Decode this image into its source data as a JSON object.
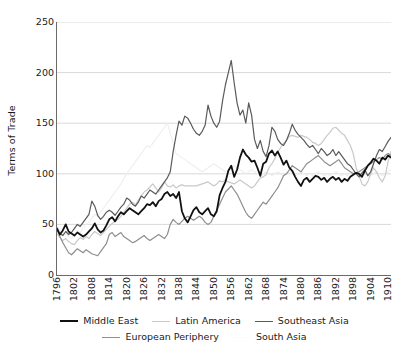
{
  "chart_data": {
    "type": "line",
    "title": "",
    "xlabel": "",
    "ylabel": "Terms of Trade",
    "xlim": [
      1796,
      1911
    ],
    "ylim": [
      0,
      250
    ],
    "yticks": [
      0,
      50,
      100,
      150,
      200,
      250
    ],
    "xticks": [
      1796,
      1802,
      1808,
      1814,
      1820,
      1826,
      1832,
      1838,
      1844,
      1850,
      1856,
      1862,
      1868,
      1874,
      1880,
      1886,
      1892,
      1898,
      1904,
      1910
    ],
    "grid": "horizontal",
    "legend_position": "below",
    "colors": {
      "middle_east": "#111111",
      "latin_america": "#c9c9c9",
      "southeast_asia": "#5a5a5a",
      "european_periphery": "#8e8e8e",
      "south_asia": "#eeeeee"
    },
    "x": [
      1796,
      1797,
      1798,
      1799,
      1800,
      1801,
      1802,
      1803,
      1804,
      1805,
      1806,
      1807,
      1808,
      1809,
      1810,
      1811,
      1812,
      1813,
      1814,
      1815,
      1816,
      1817,
      1818,
      1819,
      1820,
      1821,
      1822,
      1823,
      1824,
      1825,
      1826,
      1827,
      1828,
      1829,
      1830,
      1831,
      1832,
      1833,
      1834,
      1835,
      1836,
      1837,
      1838,
      1839,
      1840,
      1841,
      1842,
      1843,
      1844,
      1845,
      1846,
      1847,
      1848,
      1849,
      1850,
      1851,
      1852,
      1853,
      1854,
      1855,
      1856,
      1857,
      1858,
      1859,
      1860,
      1861,
      1862,
      1863,
      1864,
      1865,
      1866,
      1867,
      1868,
      1869,
      1870,
      1871,
      1872,
      1873,
      1874,
      1875,
      1876,
      1877,
      1878,
      1879,
      1880,
      1881,
      1882,
      1883,
      1884,
      1885,
      1886,
      1887,
      1888,
      1889,
      1890,
      1891,
      1892,
      1893,
      1894,
      1895,
      1896,
      1897,
      1898,
      1899,
      1900,
      1901,
      1902,
      1903,
      1904,
      1905,
      1906,
      1907,
      1908,
      1909,
      1910,
      1911
    ],
    "series": [
      {
        "name": "Middle East",
        "color": "#111111",
        "width": 1.8,
        "values": [
          46,
          40,
          44,
          50,
          43,
          41,
          39,
          42,
          40,
          38,
          40,
          43,
          46,
          51,
          45,
          42,
          44,
          49,
          55,
          57,
          53,
          58,
          62,
          60,
          63,
          66,
          64,
          62,
          60,
          63,
          66,
          70,
          69,
          72,
          68,
          73,
          75,
          80,
          82,
          78,
          80,
          76,
          82,
          63,
          56,
          52,
          58,
          64,
          67,
          62,
          60,
          63,
          66,
          60,
          58,
          63,
          79,
          86,
          92,
          103,
          108,
          97,
          104,
          116,
          124,
          119,
          116,
          112,
          113,
          106,
          98,
          110,
          112,
          120,
          123,
          118,
          122,
          116,
          109,
          113,
          106,
          103,
          97,
          92,
          88,
          94,
          96,
          92,
          95,
          98,
          97,
          94,
          96,
          92,
          95,
          97,
          94,
          96,
          92,
          95,
          93,
          97,
          99,
          101,
          100,
          97,
          103,
          108,
          111,
          115,
          113,
          110,
          116,
          114,
          118,
          116
        ]
      },
      {
        "name": "Latin America",
        "color": "#c9c9c9",
        "width": 1.2,
        "values": [
          41,
          37,
          34,
          36,
          33,
          31,
          30,
          34,
          37,
          35,
          38,
          36,
          40,
          43,
          41,
          39,
          42,
          45,
          48,
          51,
          53,
          55,
          58,
          62,
          66,
          70,
          72,
          69,
          74,
          78,
          82,
          84,
          87,
          90,
          86,
          82,
          86,
          92,
          88,
          87,
          89,
          86,
          88,
          89,
          88,
          88,
          88,
          88,
          88,
          89,
          90,
          91,
          92,
          90,
          88,
          90,
          93,
          92,
          94,
          92,
          91,
          90,
          92,
          94,
          92,
          90,
          88,
          86,
          88,
          92,
          96,
          97,
          99,
          106,
          110,
          115,
          121,
          126,
          130,
          133,
          137,
          138,
          137,
          136,
          138,
          137,
          136,
          134,
          131,
          130,
          128,
          130,
          134,
          138,
          141,
          145,
          146,
          143,
          140,
          138,
          133,
          128,
          120,
          106,
          98,
          90,
          88,
          92,
          100,
          106,
          102,
          96,
          92,
          98,
          112,
          122
        ]
      },
      {
        "name": "Southeast Asia",
        "color": "#5a5a5a",
        "width": 1.2,
        "values": [
          44,
          41,
          39,
          43,
          40,
          42,
          46,
          50,
          48,
          52,
          56,
          60,
          73,
          68,
          59,
          55,
          58,
          62,
          64,
          62,
          59,
          63,
          67,
          70,
          76,
          74,
          70,
          68,
          72,
          78,
          76,
          80,
          84,
          82,
          80,
          84,
          88,
          92,
          96,
          102,
          122,
          138,
          152,
          148,
          157,
          155,
          150,
          144,
          140,
          138,
          142,
          148,
          168,
          157,
          150,
          146,
          152,
          172,
          188,
          200,
          212,
          190,
          170,
          158,
          163,
          150,
          170,
          158,
          134,
          125,
          133,
          122,
          117,
          128,
          146,
          142,
          134,
          130,
          128,
          133,
          140,
          149,
          143,
          139,
          136,
          133,
          129,
          126,
          128,
          124,
          120,
          125,
          122,
          118,
          120,
          124,
          118,
          122,
          118,
          114,
          110,
          108,
          104,
          100,
          97,
          101,
          104,
          98,
          102,
          110,
          118,
          124,
          122,
          127,
          132,
          136
        ]
      },
      {
        "name": "European Periphery",
        "color": "#8e8e8e",
        "width": 1.2,
        "values": [
          45,
          38,
          32,
          27,
          22,
          20,
          23,
          26,
          24,
          22,
          25,
          23,
          21,
          20,
          19,
          23,
          27,
          31,
          40,
          42,
          38,
          40,
          42,
          38,
          36,
          34,
          32,
          33,
          35,
          37,
          39,
          36,
          34,
          36,
          38,
          40,
          38,
          36,
          40,
          50,
          55,
          52,
          50,
          53,
          56,
          58,
          56,
          54,
          56,
          58,
          56,
          52,
          50,
          52,
          58,
          64,
          70,
          76,
          82,
          85,
          88,
          84,
          80,
          74,
          68,
          62,
          58,
          56,
          60,
          64,
          68,
          72,
          70,
          74,
          78,
          82,
          86,
          92,
          98,
          100,
          104,
          108,
          106,
          104,
          102,
          106,
          110,
          112,
          114,
          116,
          118,
          115,
          112,
          110,
          108,
          110,
          112,
          114,
          110,
          106,
          104,
          102,
          100,
          101,
          102,
          104,
          106,
          108,
          110,
          112,
          114,
          116,
          114,
          118,
          120,
          118
        ]
      },
      {
        "name": "South Asia",
        "color": "#eeeeee",
        "width": 1.1,
        "values": [
          48,
          44,
          42,
          40,
          38,
          36,
          40,
          44,
          42,
          46,
          50,
          52,
          56,
          60,
          58,
          62,
          66,
          70,
          74,
          78,
          82,
          86,
          90,
          95,
          100,
          104,
          108,
          112,
          116,
          120,
          124,
          128,
          126,
          130,
          134,
          138,
          142,
          146,
          150,
          140,
          130,
          120,
          118,
          116,
          114,
          112,
          110,
          108,
          106,
          104,
          102,
          104,
          106,
          108,
          110,
          108,
          106,
          104,
          102,
          104,
          106,
          108,
          106,
          104,
          102,
          100,
          102,
          104,
          102,
          100,
          98,
          100,
          102,
          100,
          98,
          100,
          102,
          100,
          98,
          100,
          102,
          100,
          98,
          100,
          102,
          100,
          98,
          100,
          98,
          100,
          102,
          100,
          98,
          100,
          98,
          100,
          102,
          100,
          98,
          100,
          98,
          100,
          102,
          100,
          98,
          100,
          102,
          100,
          98,
          100,
          102,
          100,
          98,
          100,
          102,
          104
        ]
      }
    ]
  },
  "axes": {
    "ytick_labels": [
      "250",
      "200",
      "150",
      "100",
      "50",
      "0"
    ],
    "xtick_labels": [
      "1796",
      "1802",
      "1808",
      "1814",
      "1820",
      "1826",
      "1832",
      "1838",
      "1844",
      "1850",
      "1856",
      "1862",
      "1868",
      "1874",
      "1880",
      "1886",
      "1892",
      "1898",
      "1904",
      "1910"
    ],
    "ylabel_text": "Terms of Trade"
  },
  "legend": {
    "row1": [
      {
        "label": "Middle East",
        "color": "#111111",
        "width": 2.2
      },
      {
        "label": "Latin America",
        "color": "#c9c9c9",
        "width": 1.4
      },
      {
        "label": "Southeast Asia",
        "color": "#5a5a5a",
        "width": 1.4
      }
    ],
    "row2": [
      {
        "label": "European Periphery",
        "color": "#8e8e8e",
        "width": 1.4
      },
      {
        "label": "South Asia",
        "color": "#fbfbfb",
        "width": 1.4
      }
    ]
  }
}
